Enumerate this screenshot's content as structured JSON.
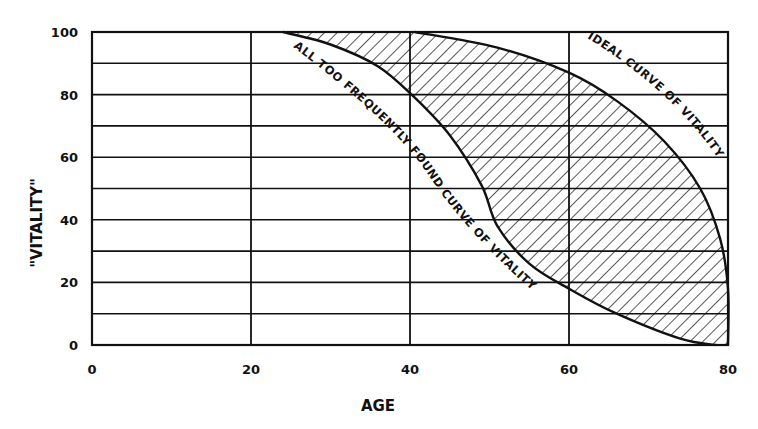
{
  "chart_data": {
    "type": "area",
    "title": "",
    "xlabel": "AGE",
    "ylabel": "\"VITALITY\"",
    "xlim": [
      0,
      80
    ],
    "ylim": [
      0,
      100
    ],
    "x_ticks": [
      "0",
      "20",
      "40",
      "60",
      "80"
    ],
    "y_ticks": [
      "0",
      "20",
      "40",
      "60",
      "80",
      "100"
    ],
    "grid": {
      "vertical_every": 20,
      "horizontal_every": 10
    },
    "series": [
      {
        "name": "IDEAL CURVE OF VITALITY",
        "x": [
          0,
          40.6,
          51,
          60,
          66,
          72,
          76.5,
          79,
          80,
          80
        ],
        "y": [
          100,
          100,
          95,
          87,
          78,
          65,
          50,
          34,
          18,
          0
        ]
      },
      {
        "name": "ALL TOO FREQUENTLY FOUND CURVE OF VITALITY",
        "x": [
          0,
          24,
          30,
          36,
          40.6,
          45,
          49,
          51,
          55,
          60,
          66,
          74,
          78.5,
          80
        ],
        "y": [
          100,
          100,
          96,
          89,
          79,
          67,
          51,
          38,
          26,
          18,
          10,
          2,
          0,
          0
        ]
      }
    ],
    "annotations": [
      {
        "text": "IDEAL CURVE OF VITALITY",
        "position": "along upper curve"
      },
      {
        "text": "ALL TOO FREQUENTLY FOUND CURVE OF VITALITY",
        "position": "along lower curve"
      }
    ],
    "shaded_region": "hatched area between the ideal and frequently found curves"
  }
}
